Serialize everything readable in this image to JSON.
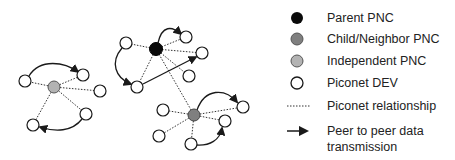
{
  "colors": {
    "parent": "#0a0a0a",
    "child": "#7f7f7f",
    "independent": "#b3b3b3",
    "dev": "#ffffff",
    "stroke": "#1a1a1a"
  },
  "legend": {
    "items": [
      {
        "symbol": "parent-pnc",
        "label": "Parent PNC"
      },
      {
        "symbol": "child-pnc",
        "label": "Child/Neighbor PNC"
      },
      {
        "symbol": "independent-pnc",
        "label": "Independent PNC"
      },
      {
        "symbol": "piconet-dev",
        "label": "Piconet DEV"
      },
      {
        "symbol": "dotted-line",
        "label": "Piconet relationship"
      },
      {
        "symbol": "arrow",
        "label_line1": "Peer to peer data",
        "label_line2": "transmission"
      }
    ]
  },
  "clusters": [
    {
      "name": "independent-piconet",
      "center_type": "independent",
      "center": [
        54,
        87
      ],
      "devices": [
        [
          25,
          81
        ],
        [
          83,
          75
        ],
        [
          100,
          91
        ],
        [
          86,
          114
        ],
        [
          33,
          125
        ]
      ]
    },
    {
      "name": "parent-piconet",
      "center_type": "parent",
      "center": [
        156,
        49
      ],
      "devices": [
        [
          126,
          43
        ],
        [
          186,
          37
        ],
        [
          202,
          53
        ],
        [
          189,
          76
        ],
        [
          137,
          87
        ]
      ]
    },
    {
      "name": "child-piconet",
      "center_type": "child",
      "center": [
        194,
        115
      ],
      "devices": [
        [
          163,
          110
        ],
        [
          243,
          107
        ],
        [
          225,
          121
        ],
        [
          159,
          136
        ],
        [
          191,
          144
        ]
      ]
    }
  ]
}
